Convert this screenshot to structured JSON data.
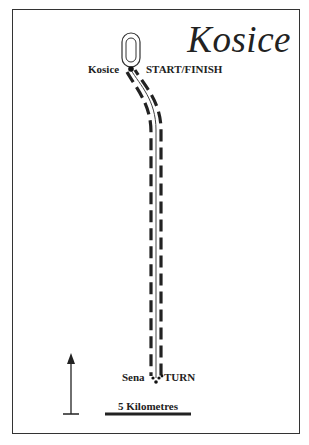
{
  "map": {
    "title": "Kosice",
    "start": {
      "town_label": "Kosice",
      "point_label": "START/FINISH"
    },
    "turn": {
      "town_label": "Sena",
      "point_label": "TURN"
    },
    "scale_bar": {
      "label": "5 Kilometres"
    },
    "north_arrow": {
      "icon": "north-arrow-icon"
    },
    "colors": {
      "ink": "#222222",
      "background": "#ffffff"
    }
  }
}
